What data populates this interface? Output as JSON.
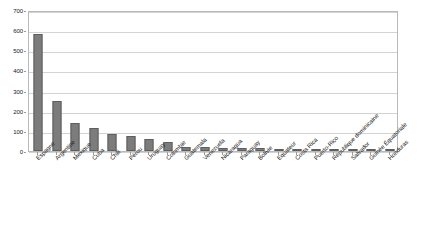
{
  "chart_data": {
    "type": "bar",
    "title": "",
    "subtitle": "",
    "xlabel": "",
    "ylabel": "",
    "ylim": [
      0,
      700
    ],
    "ytick_step": 100,
    "yticks": [
      "0",
      "100",
      "200",
      "300",
      "400",
      "500",
      "600",
      "700"
    ],
    "grid": true,
    "grid_axis": "y",
    "legend": false,
    "legend_position": "none",
    "bar_color": "#7c7c7c",
    "bar_edge_color": "#5e5e5e",
    "plot_border_color": "#b9b9b9",
    "gridline_color": "#d3d3d3",
    "background_color": "#ffffff",
    "xtick_rotation": -45,
    "categories": [
      "Espagne",
      "Argentine",
      "Mexique",
      "Cuba",
      "Chili",
      "Pérou",
      "Uruguay",
      "Colombie",
      "Guatemala",
      "Venezuela",
      "Nicaragua",
      "Paraguay",
      "Bolivie",
      "Equateur",
      "Costa Rica",
      "Puerto-Rico",
      "République dominicaine",
      "Salvador",
      "Guinée Équatoriale",
      "Honduras"
    ],
    "values": [
      580,
      250,
      140,
      112,
      84,
      73,
      58,
      43,
      20,
      20,
      16,
      14,
      13,
      10,
      8,
      6,
      5,
      4,
      3,
      2
    ]
  },
  "caption": {
    "text": ""
  }
}
